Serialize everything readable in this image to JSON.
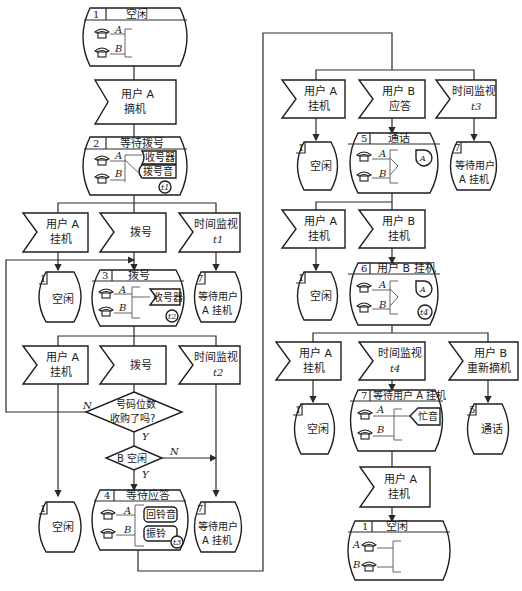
{
  "diagram": {
    "type": "SDL state transition diagram (telephone call processing)",
    "left_column": {
      "state1": {
        "number": "1",
        "title": "空闲",
        "line_a": "A",
        "line_b": "B"
      },
      "input_offhook": {
        "line1": "用户 A",
        "line2": "摘机"
      },
      "state2": {
        "number": "2",
        "title": "等待拨号",
        "line_a": "A",
        "line_b": "B",
        "res1": "收号器",
        "res2": "拨号音",
        "timer": "t1"
      },
      "inputs_row1": [
        {
          "line1": "用户 A",
          "line2": "挂机"
        },
        {
          "line1": "拨号",
          "line2": ""
        },
        {
          "line1": "时间监视",
          "line2": "t1"
        }
      ],
      "next_states_row1": [
        {
          "number": "1",
          "label1": "空闲",
          "label2": ""
        },
        {
          "number": "7",
          "label1": "等待用户",
          "label2": "A 挂机"
        }
      ],
      "state3": {
        "number": "3",
        "title": "拨号",
        "line_a": "A",
        "line_b": "B",
        "res1": "收号器",
        "timer": "t2"
      },
      "inputs_row2": [
        {
          "line1": "用户 A",
          "line2": "挂机"
        },
        {
          "line1": "拨号",
          "line2": ""
        },
        {
          "line1": "时间监视",
          "line2": "t2"
        }
      ],
      "decision1": {
        "line1": "号码位数",
        "line2": "收购了吗?",
        "no": "N",
        "yes": "Y"
      },
      "decision2": {
        "text": "B 空闲",
        "no": "N",
        "yes": "Y"
      },
      "next_states_row2": [
        {
          "number": "1",
          "label1": "空闲",
          "label2": ""
        },
        {
          "number": "7",
          "label1": "等待用户",
          "label2": "A 挂机"
        }
      ],
      "state4": {
        "number": "4",
        "title": "等待应答",
        "line_a": "A",
        "line_b": "B",
        "res1": "回铃音",
        "res2": "振铃",
        "timer": "t3"
      }
    },
    "right_column": {
      "inputs_row1": [
        {
          "line1": "用户 A",
          "line2": "挂机"
        },
        {
          "line1": "用户 B",
          "line2": "应答"
        },
        {
          "line1": "时间监视",
          "line2": "t3"
        }
      ],
      "next_states_row1": [
        {
          "number": "1",
          "label1": "空闲",
          "label2": ""
        },
        {
          "number": "7",
          "label1": "等待用户",
          "label2": "A 挂机"
        }
      ],
      "state5": {
        "number": "5",
        "title": "通话",
        "line_a": "A",
        "line_b": "B",
        "billing": "A"
      },
      "inputs_row2": [
        {
          "line1": "用户 A",
          "line2": "挂机"
        },
        {
          "line1": "用户 B",
          "line2": "挂机"
        }
      ],
      "next_states_row2": [
        {
          "number": "1",
          "label1": "空闲",
          "label2": ""
        }
      ],
      "state6": {
        "number": "6",
        "title": "用户 B 挂机",
        "line_a": "A",
        "line_b": "B",
        "billing": "A",
        "timer": "t4"
      },
      "inputs_row3": [
        {
          "line1": "用户 A",
          "line2": "挂机"
        },
        {
          "line1": "时间监视",
          "line2": "t4"
        },
        {
          "line1": "用户 B",
          "line2": "重新摘机"
        }
      ],
      "next_states_row3": [
        {
          "number": "1",
          "label1": "空闲",
          "label2": ""
        },
        {
          "number": "5",
          "label1": "通话",
          "label2": ""
        }
      ],
      "state7": {
        "number": "7",
        "title": "等待用户 A 挂机",
        "line_a": "A",
        "line_b": "B",
        "res1": "忙音"
      },
      "input_final": {
        "line1": "用户 A",
        "line2": "挂机"
      },
      "state1_final": {
        "number": "1",
        "title": "空闲",
        "line_a": "A",
        "line_b": "B"
      }
    }
  }
}
